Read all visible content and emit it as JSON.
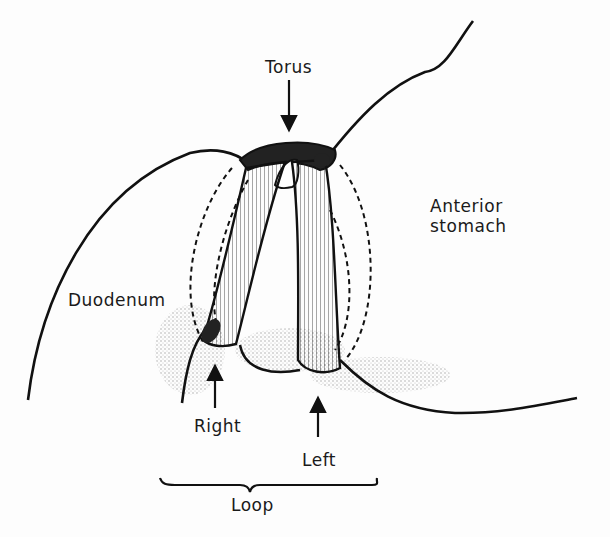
{
  "diagram": {
    "colors": {
      "ink": "#111111",
      "background": "#fdfdfd",
      "stipple": "#555555"
    },
    "labels": {
      "torus": "Torus",
      "anterior_stomach_line1": "Anterior",
      "anterior_stomach_line2": "stomach",
      "duodenum": "Duodenum",
      "right": "Right",
      "left": "Left",
      "loop": "Loop"
    },
    "arrows": [
      {
        "id": "torus-arrow",
        "direction": "down",
        "points_to": "torus"
      },
      {
        "id": "right-arrow",
        "direction": "up",
        "points_to": "right limb of loop"
      },
      {
        "id": "left-arrow",
        "direction": "up",
        "points_to": "left limb of loop"
      }
    ],
    "brace": {
      "label_ref": "loop",
      "spans": [
        "right",
        "left"
      ]
    }
  }
}
